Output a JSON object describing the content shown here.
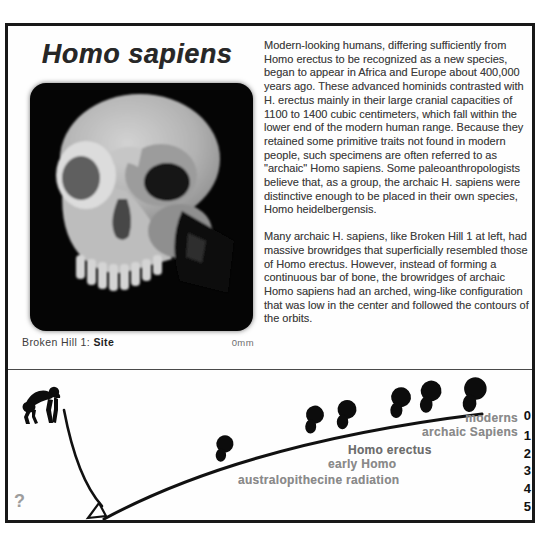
{
  "header": {
    "title": "Homo sapiens"
  },
  "photo": {
    "subject": "Broken Hill 1 skull, frontal view on black background",
    "caption_specimen": "Broken Hill 1:",
    "caption_site": "Site",
    "scale_label": "0mm"
  },
  "article": {
    "paragraph1": "Modern-looking humans, differing sufficiently from Homo erectus to be recognized as a new species, began to appear in Africa and Europe about 400,000 years ago. These advanced hominids contrasted with H. erectus mainly in their large cranial capacities of 1100 to 1400 cubic centimeters, which fall within the lower end of the modern human range. Because they retained some primitive traits not found in modern people, such specimens are often referred to as \"archaic\" Homo sapiens. Some paleoanthropologists believe that, as a group, the archaic H. sapiens were distinctive enough to be placed in their own species, Homo heidelbergensis.",
    "paragraph2": "Many archaic H. sapiens, like Broken Hill 1 at left, had massive browridges that superficially resembled those of Homo erectus. However, instead of forming a continuous bar of bone, the browridges of archaic Homo sapiens had an arched, wing-like configuration that was low in the center and followed the contours of the orbits."
  },
  "timeline": {
    "description": "Evolutionary timeline curve from ape ancestor through australopithecines to modern humans",
    "question_mark": "?",
    "labels": {
      "moderns": "moderns",
      "archaic_sapiens": "archaic Sapiens",
      "homo_erectus": "Homo erectus",
      "early_homo": "early Homo",
      "australopithecine": "australopithecine radiation"
    },
    "ticks": [
      "0",
      "1",
      "2",
      "3",
      "4",
      "5"
    ]
  },
  "colors": {
    "frame_border": "#181818",
    "photo_background": "#050505",
    "label_gray": "#8a8a8a",
    "curve_black": "#111111",
    "text_dark": "#3d3d3d"
  }
}
